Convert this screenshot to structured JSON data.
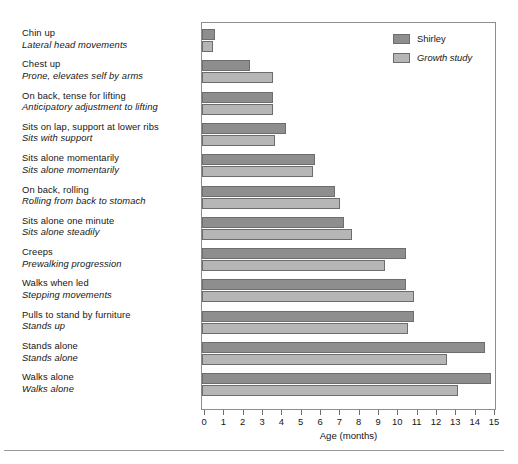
{
  "chart_data": {
    "type": "bar",
    "orientation": "horizontal",
    "title": "",
    "xlabel": "Age (months)",
    "ylabel": "",
    "xlim": [
      0,
      15
    ],
    "xticks": [
      0,
      1,
      2,
      3,
      4,
      5,
      6,
      7,
      8,
      9,
      10,
      11,
      12,
      13,
      14,
      15
    ],
    "xtick_labels": [
      "0",
      "1",
      "2",
      "3",
      "4",
      "5",
      "6",
      "7",
      "8",
      "9",
      "10",
      "11",
      "12",
      "13",
      "14",
      "15"
    ],
    "grid": false,
    "legend_position": "top-right",
    "categories": [
      "Chin up",
      "Chest up",
      "On back, tense for lifting",
      "Sits on lap, support at lower ribs",
      "Sits alone momentarily",
      "On back, rolling",
      "Sits alone one minute",
      "Creeps",
      "Walks when led",
      "Pulls to stand by furniture",
      "Stands alone",
      "Walks alone"
    ],
    "categories_secondary": [
      "Lateral head movements",
      "Prone, elevates self by arms",
      "Anticipatory adjustment to lifting",
      "Sits with support",
      "Sits alone momentarily",
      "Rolling from back to stomach",
      "Sits alone steadily",
      "Prewalking progression",
      "Stepping movements",
      "Stands up",
      "Stands alone",
      "Walks alone"
    ],
    "series": [
      {
        "name": "Shirley",
        "color": "#8e8e8e",
        "values": [
          0.5,
          2.3,
          3.5,
          4.2,
          5.7,
          6.7,
          7.2,
          10.4,
          10.4,
          10.8,
          14.5,
          14.8
        ]
      },
      {
        "name": "Growth study",
        "color": "#b6b6b6",
        "values": [
          0.4,
          3.5,
          3.5,
          3.6,
          5.6,
          7.0,
          7.6,
          9.3,
          10.8,
          10.5,
          12.5,
          13.1
        ]
      }
    ]
  },
  "legend": {
    "items": [
      {
        "label": "Shirley",
        "color": "#8e8e8e",
        "italic": false
      },
      {
        "label": "Growth study",
        "color": "#b6b6b6",
        "italic": true
      }
    ]
  },
  "axis": {
    "x_title": "Age (months)"
  },
  "colors": {
    "shirley_bar": "#8e8e8e",
    "growth_bar": "#b6b6b6",
    "bar_outline": "#6d6d6d",
    "frame": "#8d8d8d",
    "text": "#161616",
    "background": "#ffffff"
  }
}
